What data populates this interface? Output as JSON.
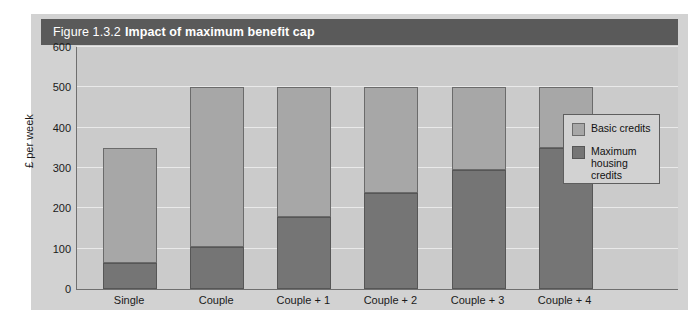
{
  "figure": {
    "title_prefix": "Figure 1.3.2",
    "title_main": "Impact of maximum benefit cap"
  },
  "legend": {
    "position": "inside-right",
    "items": [
      {
        "label": "Basic credits",
        "color": "#a7a7a7",
        "name": "basic-credits"
      },
      {
        "label": "Maximum\nhousing credits",
        "color": "#757575",
        "name": "maximum-housing-credits"
      }
    ]
  },
  "axes": {
    "ylabel": "£ per week",
    "yticks": [
      "0",
      "100",
      "200",
      "300",
      "400",
      "500",
      "600"
    ],
    "ylim_min": 0,
    "ylim_max": 600
  },
  "chart_data": {
    "type": "bar",
    "stacked": true,
    "title": "Figure 1.3.2 Impact of maximum benefit cap",
    "xlabel": "",
    "ylabel": "£ per week",
    "ylim": [
      0,
      600
    ],
    "ytick_step": 100,
    "grid": true,
    "legend_position": "inside-right",
    "categories": [
      "Single",
      "Couple",
      "Couple + 1",
      "Couple + 2",
      "Couple + 3",
      "Couple + 4"
    ],
    "series": [
      {
        "name": "Maximum housing credits",
        "color": "#757575",
        "values": [
          65,
          105,
          178,
          237,
          295,
          350
        ]
      },
      {
        "name": "Basic credits",
        "color": "#a7a7a7",
        "values": [
          285,
          395,
          322,
          263,
          205,
          150
        ]
      }
    ],
    "totals": [
      350,
      500,
      500,
      500,
      500,
      500
    ]
  }
}
